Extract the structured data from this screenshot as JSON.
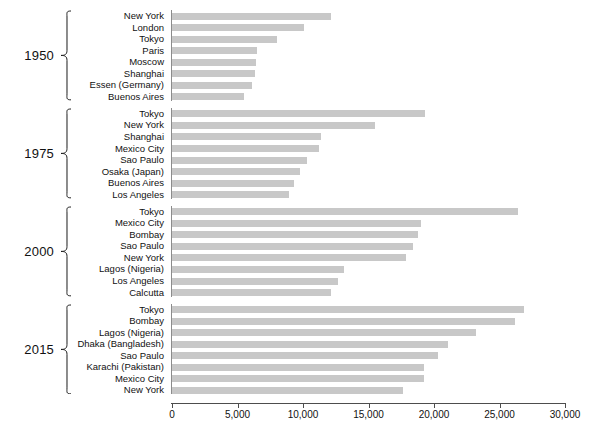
{
  "chart_data": {
    "type": "bar",
    "orientation": "horizontal",
    "title": "",
    "subtitle": "",
    "xlabel": "",
    "ylabel": "",
    "xlim": [
      0,
      30000
    ],
    "xticks": [
      0,
      5000,
      10000,
      15000,
      20000,
      25000,
      30000
    ],
    "xticklabels": [
      "0",
      "5,000",
      "10,000",
      "15,000",
      "20,000",
      "25,000",
      "30,000"
    ],
    "grid": false,
    "legend": "none",
    "bar_color": "#c8c8c8",
    "axis_color": "#4d4d4d",
    "groups": [
      {
        "year": "1950",
        "categories": [
          "New York",
          "London",
          "Tokyo",
          "Paris",
          "Moscow",
          "Shanghai",
          "Essen (Germany)",
          "Buenos Aires"
        ],
        "values": [
          12100,
          10100,
          8000,
          6500,
          6400,
          6300,
          6100,
          5500
        ]
      },
      {
        "year": "1975",
        "categories": [
          "Tokyo",
          "New York",
          "Shanghai",
          "Mexico City",
          "Sao Paulo",
          "Osaka (Japan)",
          "Buenos Aires",
          "Los Angeles"
        ],
        "values": [
          19300,
          15500,
          11400,
          11200,
          10300,
          9800,
          9300,
          8900
        ]
      },
      {
        "year": "2000",
        "categories": [
          "Tokyo",
          "Mexico City",
          "Bombay",
          "Sao Paulo",
          "New York",
          "Lagos (Nigeria)",
          "Los Angeles",
          "Calcutta"
        ],
        "values": [
          26400,
          19000,
          18800,
          18400,
          17900,
          13100,
          12700,
          12100
        ]
      },
      {
        "year": "2015",
        "categories": [
          "Tokyo",
          "Bombay",
          "Lagos (Nigeria)",
          "Dhaka (Bangladesh)",
          "Sao Paulo",
          "Karachi (Pakistan)",
          "Mexico City",
          "New York"
        ],
        "values": [
          26900,
          26200,
          23200,
          21100,
          20300,
          19200,
          19200,
          17600
        ]
      }
    ]
  }
}
